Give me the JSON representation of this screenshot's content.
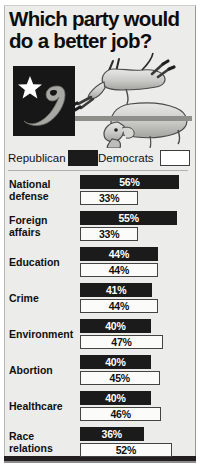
{
  "title": "Which party would do a better job?",
  "logo": {
    "name": "election-92-logo",
    "year": "92"
  },
  "illustration": {
    "donkey": "democratic-donkey",
    "elephant": "republican-elephant"
  },
  "legend": {
    "republican_label": "Republican",
    "democrats_label": "Democrats",
    "republican_color": "#1b1b1b",
    "democrats_color": "#ffffff"
  },
  "chart_data": {
    "type": "bar",
    "title": "Which party would do a better job?",
    "xlabel": "",
    "ylabel": "",
    "xlim": [
      0,
      60
    ],
    "grid": false,
    "legend_position": "top",
    "orientation": "horizontal",
    "categories": [
      "National defense",
      "Foreign affairs",
      "Education",
      "Crime",
      "Environment",
      "Abortion",
      "Healthcare",
      "Race relations"
    ],
    "series": [
      {
        "name": "Republican",
        "color": "#1b1b1b",
        "values": [
          56,
          55,
          44,
          41,
          40,
          40,
          40,
          36
        ],
        "labels": [
          "56%",
          "55%",
          "44%",
          "41%",
          "40%",
          "40%",
          "40%",
          "36%"
        ]
      },
      {
        "name": "Democrats",
        "color": "#ffffff",
        "values": [
          33,
          33,
          44,
          44,
          47,
          45,
          46,
          52
        ],
        "labels": [
          "33%",
          "33%",
          "44%",
          "44%",
          "47%",
          "45%",
          "46%",
          "52%"
        ]
      }
    ]
  },
  "rows": [
    {
      "label_line1": "National",
      "label_line2": "defense",
      "rep": "56%",
      "dem": "33%",
      "rep_w": 56,
      "dem_w": 33
    },
    {
      "label_line1": "Foreign",
      "label_line2": "affairs",
      "rep": "55%",
      "dem": "33%",
      "rep_w": 55,
      "dem_w": 33
    },
    {
      "label_line1": "Education",
      "label_line2": "",
      "rep": "44%",
      "dem": "44%",
      "rep_w": 44,
      "dem_w": 44
    },
    {
      "label_line1": "Crime",
      "label_line2": "",
      "rep": "41%",
      "dem": "44%",
      "rep_w": 41,
      "dem_w": 44
    },
    {
      "label_line1": "Environment",
      "label_line2": "",
      "rep": "40%",
      "dem": "47%",
      "rep_w": 40,
      "dem_w": 47
    },
    {
      "label_line1": "Abortion",
      "label_line2": "",
      "rep": "40%",
      "dem": "45%",
      "rep_w": 40,
      "dem_w": 45
    },
    {
      "label_line1": "Healthcare",
      "label_line2": "",
      "rep": "40%",
      "dem": "46%",
      "rep_w": 40,
      "dem_w": 46
    },
    {
      "label_line1": "Race",
      "label_line2": "relations",
      "rep": "36%",
      "dem": "52%",
      "rep_w": 36,
      "dem_w": 52
    }
  ]
}
